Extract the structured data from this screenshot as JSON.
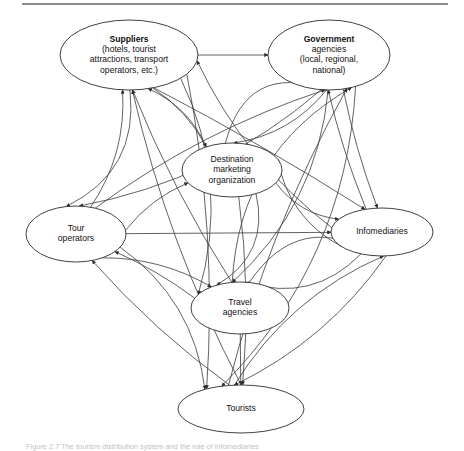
{
  "figure": {
    "caption": "Figure 2.7  The tourism distribution system and the role of infomediaries",
    "top_rule_color": "#8c8c8c",
    "line_color": "#3a3a3a",
    "node_fill": "#ffffff",
    "node_stroke": "#2b2b2b"
  },
  "nodes": [
    {
      "id": "suppliers",
      "name": "suppliers",
      "lines": [
        "Suppliers",
        "(hotels, tourist",
        "attractions, transport",
        "operators, etc.)"
      ],
      "bold_first_line": true,
      "cx": 129,
      "cy": 55,
      "rx": 69,
      "ry": 35
    },
    {
      "id": "government",
      "name": "government-agencies",
      "lines": [
        "Government",
        "agencies",
        "(local, regional,",
        "national)"
      ],
      "bold_first_line": true,
      "cx": 329,
      "cy": 55,
      "rx": 61,
      "ry": 35
    },
    {
      "id": "dmo",
      "name": "destination-marketing-organization",
      "lines": [
        "Destination",
        "marketing",
        "organization"
      ],
      "bold_first_line": false,
      "cx": 232,
      "cy": 170,
      "rx": 50,
      "ry": 27
    },
    {
      "id": "touroperators",
      "name": "tour-operators",
      "lines": [
        "Tour",
        "operators"
      ],
      "bold_first_line": false,
      "cx": 76,
      "cy": 234,
      "rx": 50,
      "ry": 28
    },
    {
      "id": "infomediaries",
      "name": "infomediaries",
      "lines": [
        "Infomediaries"
      ],
      "bold_first_line": false,
      "cx": 382,
      "cy": 232,
      "rx": 51,
      "ry": 24
    },
    {
      "id": "travelagencies",
      "name": "travel-agencies",
      "lines": [
        "Travel",
        "agencies"
      ],
      "bold_first_line": false,
      "cx": 240,
      "cy": 308,
      "rx": 49,
      "ry": 26
    },
    {
      "id": "tourists",
      "name": "tourists",
      "lines": [
        "Tourists"
      ],
      "bold_first_line": false,
      "cx": 241,
      "cy": 409,
      "rx": 63,
      "ry": 24
    }
  ],
  "edges": [
    {
      "name": "suppliers-government-bidirectional",
      "from": "suppliers",
      "to": "government",
      "direction": "both"
    },
    {
      "name": "touroperators-infomediaries-bidirectional",
      "from": "touroperators",
      "to": "infomediaries",
      "direction": "both"
    },
    {
      "name": "travelagencies-tourists-bidirectional",
      "from": "travelagencies",
      "to": "tourists",
      "direction": "both"
    },
    {
      "name": "touroperators-to-suppliers",
      "from": "touroperators",
      "to": "suppliers",
      "direction": "forward"
    },
    {
      "name": "travelagencies-to-suppliers",
      "from": "travelagencies",
      "to": "suppliers",
      "direction": "forward"
    },
    {
      "name": "tourists-to-suppliers",
      "from": "tourists",
      "to": "suppliers",
      "direction": "forward"
    },
    {
      "name": "infomediaries-to-suppliers",
      "from": "infomediaries",
      "to": "suppliers",
      "direction": "forward"
    },
    {
      "name": "dmo-to-suppliers",
      "from": "dmo",
      "to": "suppliers",
      "direction": "forward"
    },
    {
      "name": "touroperators-to-government",
      "from": "touroperators",
      "to": "government",
      "direction": "forward"
    },
    {
      "name": "travelagencies-to-government",
      "from": "travelagencies",
      "to": "government",
      "direction": "forward"
    },
    {
      "name": "tourists-to-government",
      "from": "tourists",
      "to": "government",
      "direction": "forward"
    },
    {
      "name": "infomediaries-to-government",
      "from": "infomediaries",
      "to": "government",
      "direction": "forward"
    },
    {
      "name": "dmo-to-government",
      "from": "dmo",
      "to": "government",
      "direction": "forward"
    },
    {
      "name": "suppliers-to-dmo",
      "from": "suppliers",
      "to": "dmo",
      "direction": "forward"
    },
    {
      "name": "government-to-dmo",
      "from": "government",
      "to": "dmo",
      "direction": "forward"
    },
    {
      "name": "touroperators-to-dmo",
      "from": "touroperators",
      "to": "dmo",
      "direction": "forward"
    },
    {
      "name": "infomediaries-to-dmo",
      "from": "infomediaries",
      "to": "dmo",
      "direction": "forward"
    },
    {
      "name": "suppliers-to-touroperators",
      "from": "suppliers",
      "to": "touroperators",
      "direction": "forward"
    },
    {
      "name": "government-to-touroperators",
      "from": "government",
      "to": "touroperators",
      "direction": "forward"
    },
    {
      "name": "travelagencies-to-touroperators",
      "from": "travelagencies",
      "to": "touroperators",
      "direction": "forward"
    },
    {
      "name": "tourists-to-touroperators",
      "from": "tourists",
      "to": "touroperators",
      "direction": "forward"
    },
    {
      "name": "suppliers-to-travelagencies",
      "from": "suppliers",
      "to": "travelagencies",
      "direction": "forward"
    },
    {
      "name": "government-to-travelagencies",
      "from": "government",
      "to": "travelagencies",
      "direction": "forward"
    },
    {
      "name": "dmo-to-travelagencies",
      "from": "dmo",
      "to": "travelagencies",
      "direction": "forward"
    },
    {
      "name": "infomediaries-to-travelagencies",
      "from": "infomediaries",
      "to": "travelagencies",
      "direction": "forward"
    },
    {
      "name": "touroperators-to-travelagencies",
      "from": "touroperators",
      "to": "travelagencies",
      "direction": "forward"
    },
    {
      "name": "suppliers-to-tourists",
      "from": "suppliers",
      "to": "tourists",
      "direction": "forward"
    },
    {
      "name": "government-to-tourists",
      "from": "government",
      "to": "tourists",
      "direction": "forward"
    },
    {
      "name": "dmo-to-tourists",
      "from": "dmo",
      "to": "tourists",
      "direction": "forward"
    },
    {
      "name": "touroperators-to-tourists",
      "from": "touroperators",
      "to": "tourists",
      "direction": "forward"
    },
    {
      "name": "infomediaries-to-tourists",
      "from": "infomediaries",
      "to": "tourists",
      "direction": "forward"
    },
    {
      "name": "suppliers-to-infomediaries",
      "from": "suppliers",
      "to": "infomediaries",
      "direction": "forward"
    },
    {
      "name": "government-to-infomediaries",
      "from": "government",
      "to": "infomediaries",
      "direction": "forward"
    },
    {
      "name": "dmo-to-infomediaries",
      "from": "dmo",
      "to": "infomediaries",
      "direction": "forward"
    },
    {
      "name": "travelagencies-to-infomediaries",
      "from": "travelagencies",
      "to": "infomediaries",
      "direction": "forward"
    },
    {
      "name": "tourists-to-infomediaries",
      "from": "tourists",
      "to": "infomediaries",
      "direction": "forward"
    }
  ]
}
